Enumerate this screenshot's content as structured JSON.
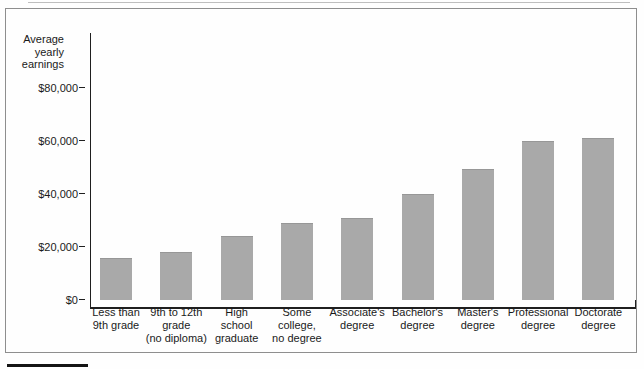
{
  "chart_data": {
    "type": "bar",
    "title": "",
    "y_axis_title": "Average yearly earnings",
    "y_axis_title_lines": [
      "Average",
      "yearly",
      "earnings"
    ],
    "categories": [
      "Less than 9th grade",
      "9th to 12th grade (no diploma)",
      "High school graduate",
      "Some college, no degree",
      "Associate's degree",
      "Bachelor's degree",
      "Master's degree",
      "Professional degree",
      "Doctorate degree"
    ],
    "category_label_lines": [
      [
        "Less than",
        "9th grade"
      ],
      [
        "9th to 12th",
        "grade",
        "(no diploma)"
      ],
      [
        "High",
        "school",
        "graduate"
      ],
      [
        "Some",
        "college,",
        "no degree"
      ],
      [
        "Associate's",
        "degree"
      ],
      [
        "Bachelor's",
        "degree"
      ],
      [
        "Master's",
        "degree"
      ],
      [
        "Professional",
        "degree"
      ],
      [
        "Doctorate",
        "degree"
      ]
    ],
    "values": [
      16000,
      18000,
      24000,
      29000,
      31000,
      40000,
      49500,
      60000,
      61000
    ],
    "yticks": [
      {
        "label": "$0",
        "value": 0
      },
      {
        "label": "$20,000",
        "value": 20000
      },
      {
        "label": "$40,000",
        "value": 40000
      },
      {
        "label": "$60,000",
        "value": 60000
      },
      {
        "label": "$80,000",
        "value": 80000
      }
    ],
    "ylim": [
      0,
      90000
    ],
    "grid": false,
    "legend": false,
    "bar_color": "#a9a9a9",
    "axis_color": "#1f1f1f",
    "text_color": "#1a1a1a",
    "frame_border_color": "#8e8e8e"
  }
}
